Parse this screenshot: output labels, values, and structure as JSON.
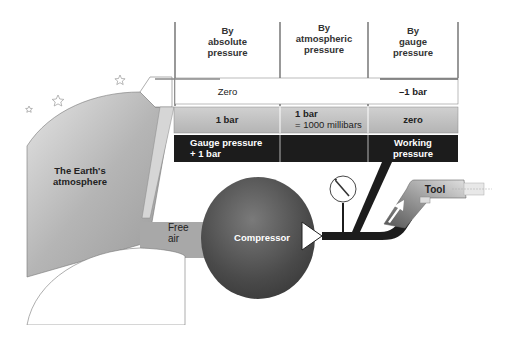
{
  "table": {
    "headers": [
      {
        "line1": "By",
        "line2": "absolute",
        "line3": "pressure"
      },
      {
        "line1": "By",
        "line2": "atmospheric",
        "line3": "pressure"
      },
      {
        "line1": "By",
        "line2": "gauge",
        "line3": "pressure"
      }
    ],
    "vacuum_row": [
      "Zero",
      "",
      "–1 bar"
    ],
    "atmosphere_row": [
      {
        "line1": "1 bar",
        "line2": ""
      },
      {
        "line1": "1 bar",
        "line2": "= 1000 millibars"
      },
      {
        "line1": "zero",
        "line2": ""
      }
    ],
    "working_row": [
      {
        "line1": "Gauge pressure",
        "line2": "+ 1 bar"
      },
      {
        "line1": "",
        "line2": ""
      },
      {
        "line1": "Working",
        "line2": "pressure"
      }
    ]
  },
  "labels": {
    "atmosphere_line1": "The Earth's",
    "atmosphere_line2": "atmosphere",
    "free_air_line1": "Free",
    "free_air_line2": "air",
    "compressor": "Compressor",
    "tool": "Tool"
  },
  "colors": {
    "atmosphere_fill": "#b8b8b8",
    "light_row": "#bdbdbd",
    "dark_row": "#1a1a1a",
    "compressor": "#555555"
  }
}
